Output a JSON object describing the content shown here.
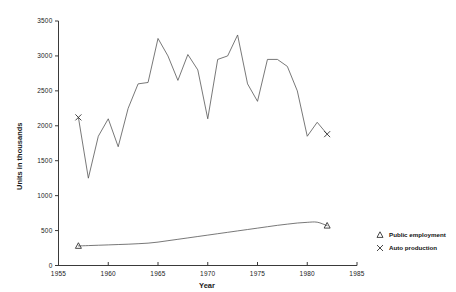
{
  "chart_data": {
    "type": "line",
    "title": "",
    "xlabel": "Year",
    "ylabel": "Units in thousands",
    "xlim": [
      1955,
      1985
    ],
    "ylim": [
      0,
      3500
    ],
    "xticks": [
      1955,
      1960,
      1965,
      1970,
      1975,
      1980,
      1985
    ],
    "yticks": [
      0,
      500,
      1000,
      1500,
      2000,
      2500,
      3000,
      3500
    ],
    "grid": false,
    "legend_position": "bottom-right",
    "series": [
      {
        "name": "Public employment",
        "marker": "triangle",
        "x": [
          1957,
          1958,
          1959,
          1960,
          1961,
          1962,
          1963,
          1964,
          1965,
          1966,
          1967,
          1968,
          1969,
          1970,
          1971,
          1972,
          1973,
          1974,
          1975,
          1976,
          1977,
          1978,
          1979,
          1980,
          1981,
          1982
        ],
        "values": [
          280,
          285,
          290,
          295,
          300,
          305,
          312,
          320,
          335,
          355,
          375,
          395,
          415,
          435,
          455,
          475,
          495,
          515,
          535,
          555,
          575,
          592,
          608,
          618,
          620,
          570
        ]
      },
      {
        "name": "Auto production",
        "marker": "x",
        "x": [
          1957,
          1958,
          1959,
          1960,
          1961,
          1962,
          1963,
          1964,
          1965,
          1966,
          1967,
          1968,
          1969,
          1970,
          1971,
          1972,
          1973,
          1974,
          1975,
          1976,
          1977,
          1978,
          1979,
          1980,
          1981,
          1982
        ],
        "values": [
          2120,
          1250,
          1850,
          2100,
          1700,
          2250,
          2600,
          2620,
          3250,
          3000,
          2650,
          3020,
          2800,
          2100,
          2950,
          3000,
          3300,
          2600,
          2350,
          2950,
          2950,
          2850,
          2500,
          1850,
          2050,
          1880
        ]
      }
    ]
  },
  "legend": {
    "entries": [
      {
        "label": "Public employment",
        "marker": "triangle"
      },
      {
        "label": "Auto production",
        "marker": "x"
      }
    ]
  }
}
